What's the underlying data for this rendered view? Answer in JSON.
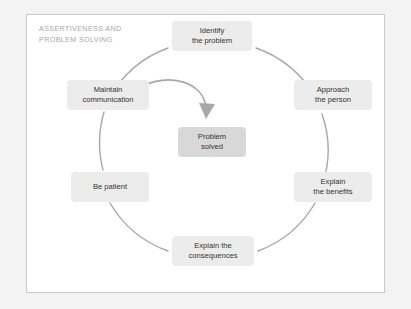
{
  "figure": {
    "title": "ASSERTIVENESS AND\nPROBLEM SOLVING",
    "type": "cycle-diagram",
    "colors": {
      "page_background": "#f3f3f3",
      "panel_background": "#ffffff",
      "panel_border": "#c9c9c9",
      "title_text": "#a9a9a9",
      "node_fill": "#ececec",
      "center_node_fill": "#d8d8d8",
      "node_text": "#333333",
      "cycle_ring": "#a8a8a8",
      "arrow": "#a8a8a8"
    }
  },
  "cycle": {
    "center_x": 212,
    "center_y": 150,
    "radius": 110,
    "direction": "clockwise",
    "nodes": [
      {
        "id": "identify",
        "label": "Identify\nthe problem",
        "position": "top",
        "order": 1
      },
      {
        "id": "approach",
        "label": "Approach\nthe person",
        "position": "upper-right",
        "order": 2
      },
      {
        "id": "benefits",
        "label": "Explain\nthe benefits",
        "position": "lower-right",
        "order": 3
      },
      {
        "id": "consequences",
        "label": "Explain the\nconsequences",
        "position": "bottom",
        "order": 4
      },
      {
        "id": "be-patient",
        "label": "Be patient",
        "position": "lower-left",
        "order": 5
      },
      {
        "id": "maintain",
        "label": "Maintain\ncommunication",
        "position": "upper-left",
        "order": 6
      }
    ]
  },
  "center": {
    "label": "Problem\nsolved"
  },
  "inner_arrow": {
    "from_node": "maintain",
    "to_node": "center",
    "style": "curved-arrow-with-head"
  }
}
